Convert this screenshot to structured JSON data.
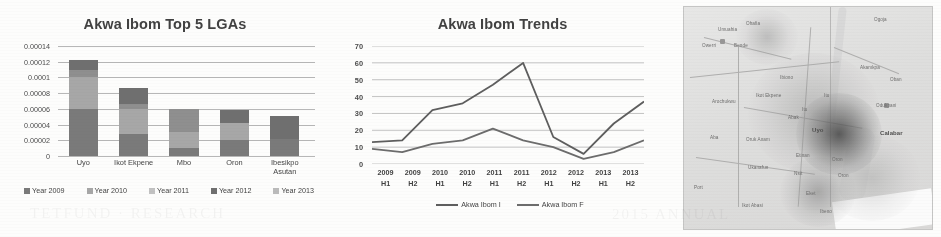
{
  "figure": {
    "panels": [
      "bar-chart",
      "line-chart",
      "density-map"
    ]
  },
  "chart_data": [
    {
      "type": "bar",
      "subtype": "stacked",
      "title": "Akwa Ibom Top 5 LGAs",
      "xlabel": "",
      "ylabel": "",
      "ylim": [
        0,
        0.00014
      ],
      "yticks": [
        "0",
        "0.00002",
        "0.00004",
        "0.00006",
        "0.00008",
        "0.0001",
        "0.00012",
        "0.00014"
      ],
      "ytick_values": [
        0,
        2e-05,
        4e-05,
        6e-05,
        8e-05,
        0.0001,
        0.00012,
        0.00014
      ],
      "grid": true,
      "legend_position": "bottom",
      "categories": [
        "Uyo",
        "Ikot Ekpene",
        "Mbo",
        "Oron",
        "Ibesikpo Asutan"
      ],
      "series": [
        {
          "name": "Year 2009",
          "values": [
            6e-05,
            2.8e-05,
            1e-05,
            2e-05,
            2.2e-05
          ],
          "color": "#7a7a7a"
        },
        {
          "name": "Year 2010",
          "values": [
            4e-05,
            3.2e-05,
            2e-05,
            2.2e-05,
            0.0,
            0.0
          ],
          "color": "#a8a8a8"
        },
        {
          "name": "Year 2011",
          "values": [
            1e-05,
            6e-06,
            3e-05,
            0.0,
            0.0
          ],
          "color": "#8f8f8f"
        },
        {
          "name": "Year 2012",
          "values": [
            1.25e-05,
            2e-05,
            0.0,
            1.7e-05,
            2.9e-05
          ],
          "color": "#6f6f6f"
        },
        {
          "name": "Year 2013",
          "values": [
            0.0,
            0.0,
            0.0,
            0.0,
            0.0
          ],
          "color": "#bdbdbd"
        }
      ],
      "totals": [
        0.000125,
        8.6e-05,
        6e-05,
        5.9e-05,
        5.1e-05
      ]
    },
    {
      "type": "line",
      "title": "Akwa Ibom Trends",
      "xlabel": "",
      "ylabel": "",
      "ylim": [
        0,
        70
      ],
      "yticks": [
        "0",
        "10",
        "20",
        "30",
        "40",
        "50",
        "60",
        "70"
      ],
      "ytick_values": [
        0,
        10,
        20,
        30,
        40,
        50,
        60,
        70
      ],
      "grid": true,
      "legend_position": "bottom",
      "x": [
        "2009 H1",
        "2009 H2",
        "2010 H1",
        "2010 H2",
        "2011 H1",
        "2011 H2",
        "2012 H1",
        "2012 H2",
        "2013 H1",
        "2013 H2"
      ],
      "x_year": [
        "2009",
        "2009",
        "2010",
        "2010",
        "2011",
        "2011",
        "2012",
        "2012",
        "2013",
        "2013"
      ],
      "x_half": [
        "H1",
        "H2",
        "H1",
        "H2",
        "H1",
        "H2",
        "H1",
        "H2",
        "H1",
        "H2"
      ],
      "series": [
        {
          "name": "Akwa Ibom I",
          "values": [
            13,
            14,
            32,
            36,
            47,
            60,
            16,
            6,
            24,
            37
          ],
          "color": "#5d5d5d"
        },
        {
          "name": "Akwa Ibom F",
          "values": [
            9,
            7,
            12,
            14,
            21,
            14,
            10,
            3,
            7,
            14
          ],
          "color": "#6b6b6b"
        }
      ]
    },
    {
      "type": "heatmap",
      "title": "",
      "description": "Density map of Akwa Ibom and surrounding region",
      "hotspots": [
        {
          "label": "Uyo",
          "intensity": "very-high"
        },
        {
          "label": "Eket",
          "intensity": "medium"
        },
        {
          "label": "Ikot Ekpene",
          "intensity": "medium"
        }
      ]
    }
  ],
  "bar_chart": {
    "title": "Akwa Ibom Top 5 LGAs",
    "yticks": [
      "0.00014",
      "0.00012",
      "0.0001",
      "0.00008",
      "0.00006",
      "0.00004",
      "0.00002",
      "0"
    ],
    "categories": [
      {
        "line1": "Uyo",
        "line2": ""
      },
      {
        "line1": "Ikot Ekpene",
        "line2": ""
      },
      {
        "line1": "Mbo",
        "line2": ""
      },
      {
        "line1": "Oron",
        "line2": ""
      },
      {
        "line1": "Ibesikpo",
        "line2": "Asutan"
      }
    ],
    "legend": [
      {
        "label": "Year 2009",
        "color": "#7a7a7a"
      },
      {
        "label": "Year 2010",
        "color": "#a8a8a8"
      },
      {
        "label": "Year 2011",
        "color": "#c4c4c4"
      },
      {
        "label": "Year 2012",
        "color": "#6f6f6f"
      },
      {
        "label": "Year 2013",
        "color": "#bdbdbd"
      }
    ]
  },
  "line_chart": {
    "title": "Akwa Ibom Trends",
    "yticks": [
      "70",
      "60",
      "50",
      "40",
      "30",
      "20",
      "10",
      "0"
    ],
    "xticks": [
      {
        "year": "2009",
        "half": "H1"
      },
      {
        "year": "2009",
        "half": "H2"
      },
      {
        "year": "2010",
        "half": "H1"
      },
      {
        "year": "2010",
        "half": "H2"
      },
      {
        "year": "2011",
        "half": "H1"
      },
      {
        "year": "2011",
        "half": "H2"
      },
      {
        "year": "2012",
        "half": "H1"
      },
      {
        "year": "2012",
        "half": "H2"
      },
      {
        "year": "2013",
        "half": "H1"
      },
      {
        "year": "2013",
        "half": "H2"
      }
    ],
    "legend": [
      {
        "label": "Akwa Ibom I",
        "color": "#5d5d5d"
      },
      {
        "label": "Akwa Ibom F",
        "color": "#6b6b6b"
      }
    ]
  },
  "map": {
    "labels": [
      {
        "text": "Calabar",
        "x": 196,
        "y": 123,
        "big": true
      },
      {
        "text": "Uyo",
        "x": 128,
        "y": 120,
        "big": true
      },
      {
        "text": "Itu",
        "x": 118,
        "y": 100
      },
      {
        "text": "Ikot Ekpene",
        "x": 72,
        "y": 86
      },
      {
        "text": "Abak",
        "x": 104,
        "y": 108
      },
      {
        "text": "Oron",
        "x": 148,
        "y": 150
      },
      {
        "text": "Eket",
        "x": 122,
        "y": 184
      },
      {
        "text": "Ibiono",
        "x": 96,
        "y": 68
      },
      {
        "text": "Arochukwu",
        "x": 28,
        "y": 92
      },
      {
        "text": "Aba",
        "x": 26,
        "y": 128
      },
      {
        "text": "Umuahia",
        "x": 34,
        "y": 20
      },
      {
        "text": "Ohafia",
        "x": 62,
        "y": 14
      },
      {
        "text": "Owerri",
        "x": 18,
        "y": 36
      },
      {
        "text": "Bende",
        "x": 50,
        "y": 36
      },
      {
        "text": "Etinan",
        "x": 112,
        "y": 146
      },
      {
        "text": "Ikot Abasi",
        "x": 58,
        "y": 196
      },
      {
        "text": "Oruk Anam",
        "x": 62,
        "y": 130
      },
      {
        "text": "Ukanafun",
        "x": 64,
        "y": 158
      },
      {
        "text": "Ogoja",
        "x": 190,
        "y": 10
      },
      {
        "text": "Odukpani",
        "x": 192,
        "y": 96
      },
      {
        "text": "Akamkpa",
        "x": 176,
        "y": 58
      },
      {
        "text": "Oban",
        "x": 206,
        "y": 70
      },
      {
        "text": "Itu",
        "x": 140,
        "y": 86
      },
      {
        "text": "Port",
        "x": 10,
        "y": 178
      },
      {
        "text": "Oron",
        "x": 154,
        "y": 166
      },
      {
        "text": "Ibeno",
        "x": 136,
        "y": 202
      },
      {
        "text": "Nsit",
        "x": 110,
        "y": 164
      }
    ]
  }
}
